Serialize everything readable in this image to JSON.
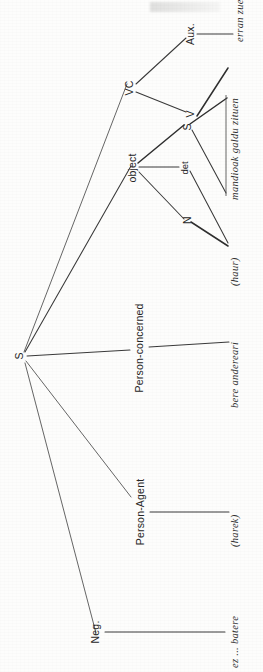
{
  "figure": {
    "orientation": "rotated-90-counterclockwise",
    "ink_color": "#303030",
    "background_color": "#fdfdfc"
  },
  "nodes": {
    "root": "S",
    "vc": "VC",
    "aux": "Aux.",
    "v": "V",
    "object": "object",
    "det": "det",
    "n": "N",
    "embedded_s": "S",
    "person_concerned": "Person-concerned",
    "person_agent": "Person-Agent",
    "neg": "Neg."
  },
  "terminals": {
    "erran_zuen": "erran zuen",
    "mandioak_galdu_zituen": "mandioak galdu zituen",
    "haur": "(haur)",
    "bere_andereari": "bere andereari",
    "harek": "(harek)",
    "ez_batere": "ez ... batere"
  }
}
